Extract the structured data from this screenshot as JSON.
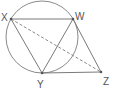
{
  "diagram": {
    "type": "geometry",
    "colors": {
      "stroke": "#7a7a7a",
      "label": "#555555",
      "background": "#ffffff"
    },
    "circle": {
      "cx": 42,
      "cy": 37,
      "r": 36
    },
    "points": {
      "X": {
        "label": "X",
        "x": 11,
        "y": 19
      },
      "W": {
        "label": "W",
        "x": 73,
        "y": 19
      },
      "Y": {
        "label": "Y",
        "x": 42,
        "y": 73
      },
      "Z": {
        "label": "Z",
        "x": 101,
        "y": 72
      }
    },
    "segments": [
      {
        "from": "X",
        "to": "W",
        "style": "solid"
      },
      {
        "from": "X",
        "to": "Y",
        "style": "solid"
      },
      {
        "from": "W",
        "to": "Y",
        "style": "solid"
      },
      {
        "from": "W",
        "to": "Z",
        "style": "solid"
      },
      {
        "from": "Y",
        "to": "Z",
        "style": "solid"
      },
      {
        "from": "X",
        "to": "Z",
        "style": "dashed"
      }
    ]
  }
}
